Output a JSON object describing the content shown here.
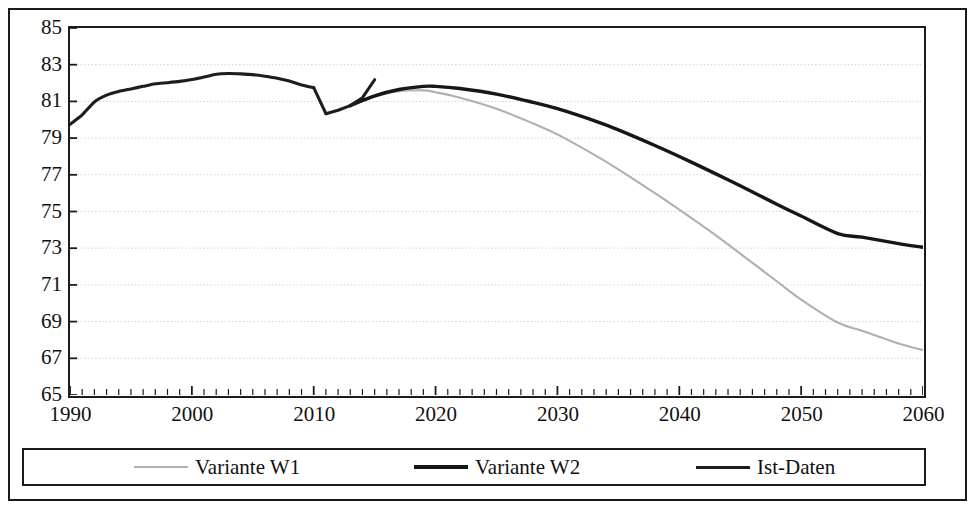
{
  "unit_label": "in Mio.",
  "legend": {
    "entries": [
      {
        "label": "Variante W1",
        "icon": "line-swatch-light-gray",
        "color": "#b0b0b0"
      },
      {
        "label": "Variante W2",
        "icon": "line-swatch-black-thick",
        "color": "#161616"
      },
      {
        "label": "Ist-Daten",
        "icon": "line-swatch-black",
        "color": "#1d1d1d"
      }
    ]
  },
  "axes": {
    "y_ticks": [
      85,
      83,
      81,
      79,
      77,
      75,
      73,
      71,
      69,
      67,
      65
    ],
    "x_ticks": [
      1990,
      2000,
      2010,
      2020,
      2030,
      2040,
      2050,
      2060
    ],
    "x_minor_step": 1
  },
  "chart_data": {
    "type": "line",
    "title": "",
    "subtitle": "",
    "xlabel": "",
    "ylabel": "in Mio.",
    "xlim": [
      1990,
      2060
    ],
    "ylim": [
      65,
      85
    ],
    "grid": "horizontal-dotted",
    "legend_position": "bottom",
    "series": [
      {
        "name": "Ist-Daten",
        "color": "#1d1d1d",
        "x": [
          1990,
          1991,
          1992,
          1993,
          1994,
          1995,
          1996,
          1997,
          1998,
          1999,
          2000,
          2001,
          2002,
          2003,
          2004,
          2005,
          2006,
          2007,
          2008,
          2009,
          2010,
          2011,
          2012,
          2013,
          2014,
          2015
        ],
        "y": [
          79.75,
          80.27,
          80.97,
          81.34,
          81.54,
          81.68,
          81.82,
          81.96,
          82.02,
          82.09,
          82.19,
          82.33,
          82.48,
          82.52,
          82.5,
          82.46,
          82.37,
          82.26,
          82.11,
          81.9,
          81.75,
          80.33,
          80.52,
          80.77,
          81.2,
          82.18
        ]
      },
      {
        "name": "Variante W2",
        "color": "#161616",
        "x": [
          2013,
          2015,
          2017,
          2019,
          2020,
          2022,
          2025,
          2028,
          2030,
          2033,
          2035,
          2038,
          2040,
          2043,
          2045,
          2048,
          2050,
          2053,
          2055,
          2058,
          2060
        ],
        "y": [
          80.77,
          81.3,
          81.65,
          81.82,
          81.82,
          81.7,
          81.4,
          80.95,
          80.6,
          79.95,
          79.45,
          78.6,
          78.0,
          77.05,
          76.4,
          75.4,
          74.75,
          73.8,
          73.6,
          73.25,
          73.05
        ]
      },
      {
        "name": "Variante W1",
        "color": "#b0b0b0",
        "x": [
          2013,
          2015,
          2017,
          2019,
          2020,
          2022,
          2025,
          2028,
          2030,
          2033,
          2035,
          2038,
          2040,
          2043,
          2045,
          2048,
          2050,
          2053,
          2055,
          2058,
          2060
        ],
        "y": [
          80.77,
          81.25,
          81.55,
          81.6,
          81.5,
          81.2,
          80.6,
          79.8,
          79.2,
          78.1,
          77.3,
          76.0,
          75.1,
          73.7,
          72.7,
          71.2,
          70.2,
          68.95,
          68.5,
          67.8,
          67.45
        ]
      }
    ]
  }
}
